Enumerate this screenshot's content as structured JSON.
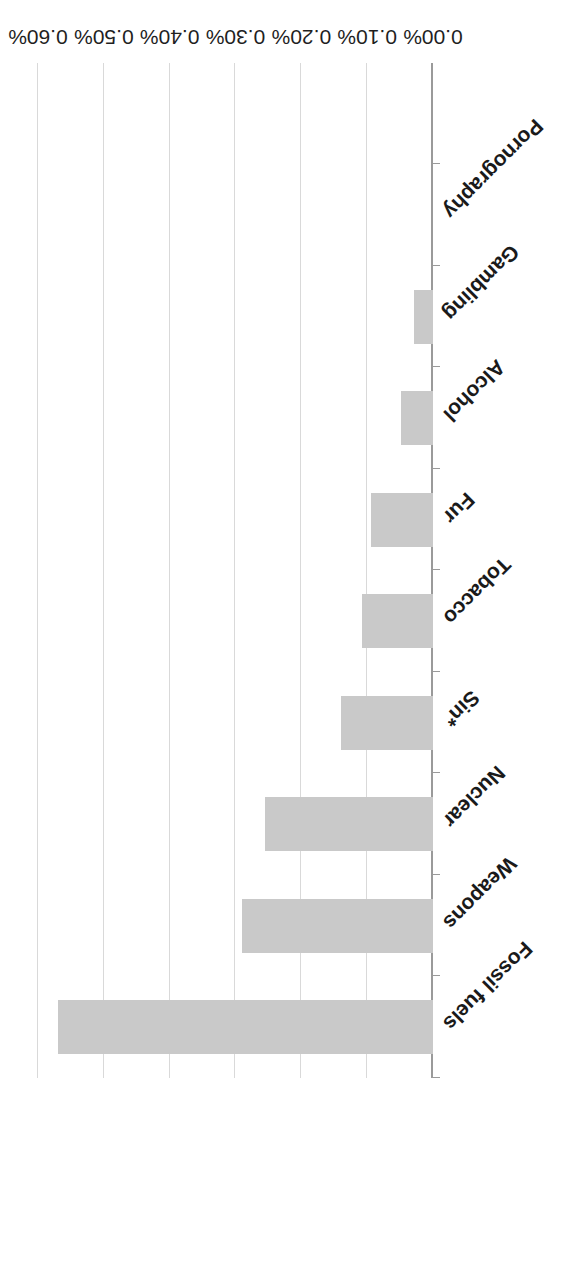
{
  "chart_data": {
    "type": "bar",
    "orientation": "horizontal",
    "title": "",
    "subtitle": "",
    "xlabel": "",
    "ylabel": "",
    "categories": [
      "Fossil fuels",
      "Weapons",
      "Nuclear",
      "Sin*",
      "Tobacco",
      "Fur",
      "Alcohol",
      "Gambling",
      "Pornography"
    ],
    "values": [
      0.57,
      0.29,
      0.255,
      0.14,
      0.108,
      0.094,
      0.049,
      0.029,
      0.0
    ],
    "value_labels": [
      "0.57%",
      "0.29%",
      "0.26%",
      "0.14%",
      "0.11%",
      "0.09%",
      "0.05%",
      "0.03%",
      "0.00%"
    ],
    "xlim": [
      0.0,
      0.6
    ],
    "tick_values": [
      0.0,
      0.1,
      0.2,
      0.3,
      0.4,
      0.5,
      0.6
    ],
    "tick_labels": [
      "0.00%",
      "0.10%",
      "0.20%",
      "0.30%",
      "0.40%",
      "0.50%",
      "0.60%"
    ],
    "grid": true,
    "grid_axis": "value",
    "legend": false,
    "legend_position": "none",
    "page_rotation_degrees": 180,
    "colors": {
      "bar_fill": "#c9c9c9",
      "gridline": "#d9d9d9",
      "axis_line": "#9a9a9a",
      "label_text": "#1a1a1a",
      "tick_text": "#1f1f1f",
      "background": "#ffffff"
    },
    "notes": {
      "footnote_marker": "*",
      "footnote_category": "Sin*"
    }
  }
}
